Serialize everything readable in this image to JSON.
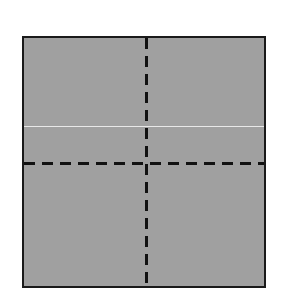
{
  "diagram": {
    "shape": "square",
    "fill_color": "#a0a0a0",
    "border_color": "#1a1a1a",
    "divisions": {
      "vertical_dashed": 1,
      "horizontal_dashed": 1,
      "quadrants": 4
    },
    "artifact_line_color": "#e8e8e8"
  }
}
